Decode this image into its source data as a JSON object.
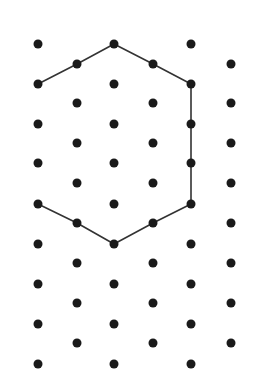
{
  "diagram": {
    "type": "isometric-dot-grid",
    "colors": {
      "background": "#ffffff",
      "dot": "#1a1a1a",
      "line": "#333333"
    },
    "dot_radius": 4.5,
    "line_width": 1.6,
    "columns_a": {
      "x": [
        38,
        114,
        191
      ],
      "y": [
        44,
        84,
        124,
        163,
        204,
        244,
        284,
        324,
        364
      ]
    },
    "columns_b": {
      "x": [
        77,
        153,
        231
      ],
      "y": [
        64,
        103,
        143,
        183,
        223,
        263,
        303,
        343
      ]
    },
    "polyline": [
      [
        38,
        84
      ],
      [
        77,
        64
      ],
      [
        114,
        44
      ],
      [
        153,
        64
      ],
      [
        191,
        84
      ],
      [
        191,
        124
      ],
      [
        191,
        163
      ],
      [
        191,
        204
      ],
      [
        153,
        223
      ],
      [
        114,
        244
      ],
      [
        77,
        223
      ],
      [
        38,
        204
      ]
    ]
  }
}
